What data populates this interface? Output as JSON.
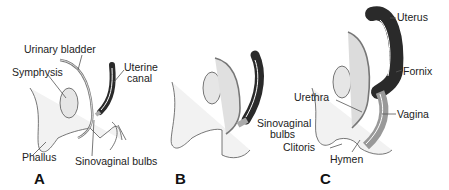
{
  "figure": {
    "panels": [
      {
        "id": "A",
        "letter": "A",
        "labels": {
          "urinary_bladder": "Urinary bladder",
          "symphysis": "Symphysis",
          "uterine_canal_1": "Uterine",
          "uterine_canal_2": "canal",
          "phallus": "Phallus",
          "sinovaginal_bulbs": "Sinovaginal bulbs"
        }
      },
      {
        "id": "B",
        "letter": "B",
        "labels": {
          "sinovaginal_bulbs_1": "Sinovaginal",
          "sinovaginal_bulbs_2": "bulbs"
        }
      },
      {
        "id": "C",
        "letter": "C",
        "labels": {
          "uterus": "Uterus",
          "fornix": "Fornix",
          "urethra": "Urethra",
          "vagina": "Vagina",
          "clitoris": "Clitoris",
          "hymen": "Hymen"
        }
      }
    ],
    "colors": {
      "dark_tissue": "#2a2a2a",
      "light_tissue": "#d9d9d9",
      "stipple": "#ececec",
      "outline": "#555555"
    }
  }
}
